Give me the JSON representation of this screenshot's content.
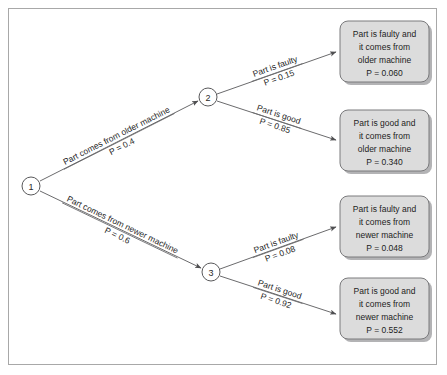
{
  "diagram": {
    "type": "probability-tree",
    "nodes": [
      {
        "id": "1",
        "label": "1",
        "cx": 31,
        "cy": 186,
        "r": 9
      },
      {
        "id": "2",
        "label": "2",
        "cx": 208,
        "cy": 97,
        "r": 9
      },
      {
        "id": "3",
        "label": "3",
        "cx": 211,
        "cy": 272,
        "r": 9
      }
    ],
    "branches": [
      {
        "id": "older-machine",
        "from": "1",
        "to": "2",
        "label": "Part comes from older machine",
        "probability_label": "P = 0.4",
        "probability": 0.4
      },
      {
        "id": "newer-machine",
        "from": "1",
        "to": "3",
        "label": "Part comes from newer machine",
        "probability_label": "P = 0.6",
        "probability": 0.6
      },
      {
        "id": "older-faulty",
        "from": "2",
        "to": "outcome-1",
        "label": "Part is faulty",
        "probability_label": "P = 0.15",
        "probability": 0.15
      },
      {
        "id": "older-good",
        "from": "2",
        "to": "outcome-2",
        "label": "Part is good",
        "probability_label": "P = 0.85",
        "probability": 0.85
      },
      {
        "id": "newer-faulty",
        "from": "3",
        "to": "outcome-3",
        "label": "Part is faulty",
        "probability_label": "P = 0.08",
        "probability": 0.08
      },
      {
        "id": "newer-good",
        "from": "3",
        "to": "outcome-4",
        "label": "Part is good",
        "probability_label": "P = 0.92",
        "probability": 0.92
      }
    ],
    "outcomes": [
      {
        "id": "outcome-1",
        "line1": "Part is faulty and",
        "line2": "it comes from",
        "line3": "older machine",
        "line4": "P = 0.060",
        "probability": 0.06
      },
      {
        "id": "outcome-2",
        "line1": "Part is good and",
        "line2": "it comes from",
        "line3": "older machine",
        "line4": "P = 0.340",
        "probability": 0.34
      },
      {
        "id": "outcome-3",
        "line1": "Part is faulty and",
        "line2": "it comes from",
        "line3": "newer machine",
        "line4": "P = 0.048",
        "probability": 0.048
      },
      {
        "id": "outcome-4",
        "line1": "Part is good and",
        "line2": "it comes from",
        "line3": "newer machine",
        "line4": "P = 0.552",
        "probability": 0.552
      }
    ],
    "colors": {
      "box_fill": "#dcdcdc",
      "box_border": "#7a7a7c",
      "line": "#6b6b6d",
      "frame": "#a8a8a8",
      "background": "#ffffff",
      "text": "#1d1d1d"
    }
  }
}
